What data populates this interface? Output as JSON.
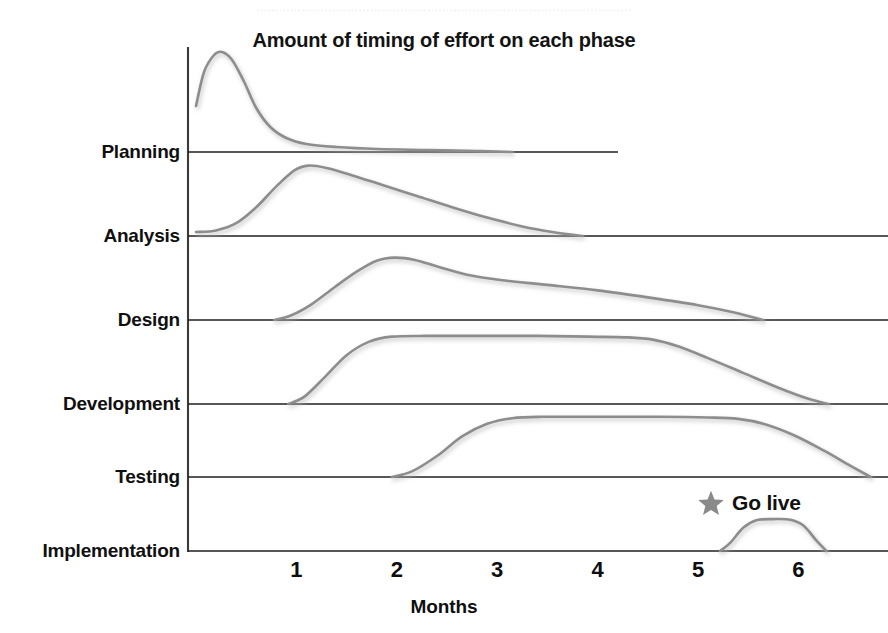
{
  "page": {
    "scan_artifact_text": "………………………………………………………………………………………"
  },
  "chart_data": {
    "type": "area",
    "title": "Amount of timing of effort on each phase",
    "subtitle": "",
    "xlabel": "Months",
    "ylabel": "",
    "xlim": [
      0,
      6.9
    ],
    "ylim": [
      0,
      1
    ],
    "grid": false,
    "legend": false,
    "legend_position": "none",
    "x_ticks": [
      1,
      2,
      3,
      4,
      5,
      6
    ],
    "x_tick_labels": [
      "1",
      "2",
      "3",
      "4",
      "5",
      "6"
    ],
    "categories": [
      "Planning",
      "Analysis",
      "Design",
      "Development",
      "Testing",
      "Implementation"
    ],
    "curve_color": "#8d8d8d",
    "shadow_color": "#c9c9c9",
    "baseline_color": "#1f1f1f",
    "axis_color": "#3a3a3a",
    "series": [
      {
        "name": "Planning",
        "start_month": 0.0,
        "peak_month": 0.25,
        "end_month": 3.15,
        "peak_height": 1.0,
        "shape": "sharp-early-spike-long-tail",
        "points": [
          [
            0.0,
            0.46
          ],
          [
            0.08,
            0.8
          ],
          [
            0.18,
            0.97
          ],
          [
            0.26,
            1.0
          ],
          [
            0.36,
            0.92
          ],
          [
            0.48,
            0.7
          ],
          [
            0.6,
            0.44
          ],
          [
            0.74,
            0.25
          ],
          [
            0.9,
            0.14
          ],
          [
            1.1,
            0.08
          ],
          [
            1.4,
            0.05
          ],
          [
            1.8,
            0.03
          ],
          [
            2.3,
            0.02
          ],
          [
            2.8,
            0.01
          ],
          [
            3.15,
            0.0
          ]
        ]
      },
      {
        "name": "Analysis",
        "start_month": 0.0,
        "peak_month": 1.1,
        "end_month": 3.85,
        "peak_height": 0.88,
        "shape": "rounded-peak-long-right-tail",
        "points": [
          [
            0.0,
            0.05
          ],
          [
            0.2,
            0.07
          ],
          [
            0.4,
            0.16
          ],
          [
            0.6,
            0.36
          ],
          [
            0.8,
            0.62
          ],
          [
            0.98,
            0.82
          ],
          [
            1.12,
            0.88
          ],
          [
            1.3,
            0.85
          ],
          [
            1.55,
            0.76
          ],
          [
            1.85,
            0.64
          ],
          [
            2.2,
            0.5
          ],
          [
            2.55,
            0.36
          ],
          [
            2.9,
            0.23
          ],
          [
            3.25,
            0.12
          ],
          [
            3.55,
            0.05
          ],
          [
            3.85,
            0.0
          ]
        ]
      },
      {
        "name": "Design",
        "start_month": 0.78,
        "peak_month": 1.95,
        "end_month": 5.65,
        "peak_height": 0.8,
        "shape": "peak-then-slow-linear-decay",
        "points": [
          [
            0.78,
            0.0
          ],
          [
            0.95,
            0.06
          ],
          [
            1.15,
            0.2
          ],
          [
            1.38,
            0.42
          ],
          [
            1.6,
            0.62
          ],
          [
            1.8,
            0.76
          ],
          [
            1.98,
            0.8
          ],
          [
            2.18,
            0.77
          ],
          [
            2.42,
            0.68
          ],
          [
            2.7,
            0.58
          ],
          [
            3.05,
            0.51
          ],
          [
            3.5,
            0.45
          ],
          [
            4.0,
            0.38
          ],
          [
            4.5,
            0.29
          ],
          [
            5.0,
            0.19
          ],
          [
            5.35,
            0.1
          ],
          [
            5.65,
            0.0
          ]
        ]
      },
      {
        "name": "Development",
        "start_month": 0.92,
        "peak_month": 3.0,
        "end_month": 6.3,
        "peak_height": 0.92,
        "shape": "broad-plateau",
        "points": [
          [
            0.92,
            0.0
          ],
          [
            1.08,
            0.1
          ],
          [
            1.28,
            0.36
          ],
          [
            1.5,
            0.66
          ],
          [
            1.72,
            0.84
          ],
          [
            1.95,
            0.91
          ],
          [
            2.3,
            0.92
          ],
          [
            2.8,
            0.92
          ],
          [
            3.4,
            0.92
          ],
          [
            3.9,
            0.91
          ],
          [
            4.3,
            0.9
          ],
          [
            4.55,
            0.87
          ],
          [
            4.8,
            0.78
          ],
          [
            5.1,
            0.62
          ],
          [
            5.45,
            0.42
          ],
          [
            5.8,
            0.22
          ],
          [
            6.1,
            0.07
          ],
          [
            6.3,
            0.0
          ]
        ]
      },
      {
        "name": "Testing",
        "start_month": 1.95,
        "peak_month": 3.6,
        "end_month": 6.72,
        "peak_height": 0.86,
        "shape": "plateau-late",
        "points": [
          [
            1.95,
            0.0
          ],
          [
            2.15,
            0.08
          ],
          [
            2.4,
            0.3
          ],
          [
            2.65,
            0.58
          ],
          [
            2.9,
            0.76
          ],
          [
            3.15,
            0.84
          ],
          [
            3.45,
            0.86
          ],
          [
            4.0,
            0.86
          ],
          [
            4.6,
            0.86
          ],
          [
            5.1,
            0.85
          ],
          [
            5.4,
            0.83
          ],
          [
            5.65,
            0.76
          ],
          [
            5.95,
            0.6
          ],
          [
            6.25,
            0.38
          ],
          [
            6.52,
            0.16
          ],
          [
            6.72,
            0.0
          ]
        ]
      },
      {
        "name": "Implementation",
        "start_month": 5.22,
        "peak_month": 5.75,
        "end_month": 6.28,
        "peak_height": 0.55,
        "shape": "short-late-bump",
        "points": [
          [
            5.22,
            0.0
          ],
          [
            5.32,
            0.14
          ],
          [
            5.45,
            0.4
          ],
          [
            5.58,
            0.53
          ],
          [
            5.75,
            0.55
          ],
          [
            5.92,
            0.54
          ],
          [
            6.05,
            0.44
          ],
          [
            6.18,
            0.18
          ],
          [
            6.28,
            0.0
          ]
        ]
      }
    ],
    "annotations": [
      {
        "name": "go-live",
        "label": "Go live",
        "icon": "star-icon",
        "icon_color": "#8a8a8a",
        "month": 5.08,
        "attached_to": "Implementation"
      }
    ]
  }
}
